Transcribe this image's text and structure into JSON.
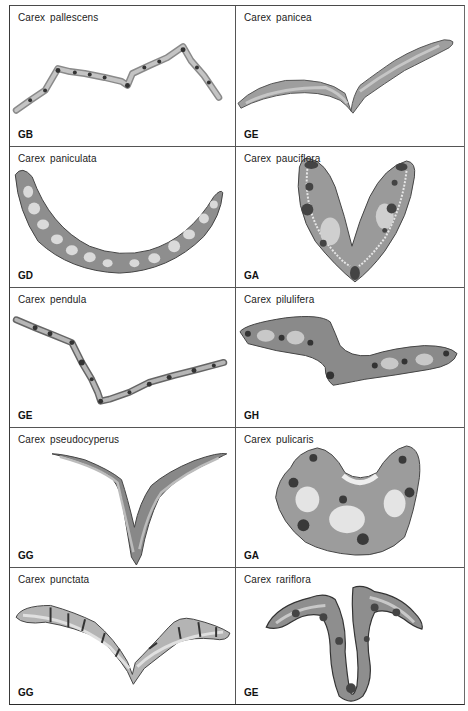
{
  "figure": {
    "panels": [
      {
        "species": "Carex  pallescens",
        "code": "GB"
      },
      {
        "species": "Carex  panicea",
        "code": "GE"
      },
      {
        "species": "Carex  paniculata",
        "code": "GD"
      },
      {
        "species": "Carex  pauciflora",
        "code": "GA"
      },
      {
        "species": "Carex  pendula",
        "code": "GE"
      },
      {
        "species": "Carex  pilulifera",
        "code": "GH"
      },
      {
        "species": "Carex  pseudocyperus",
        "code": "GG"
      },
      {
        "species": "Carex  pulicaris",
        "code": "GA"
      },
      {
        "species": "Carex  punctata",
        "code": "GG"
      },
      {
        "species": "Carex  rariflora",
        "code": "GE"
      }
    ],
    "colors": {
      "border": "#555555",
      "tissue": "#b8b8b8",
      "tissue_dark": "#555555",
      "tissue_light": "#e2e2e2"
    }
  }
}
